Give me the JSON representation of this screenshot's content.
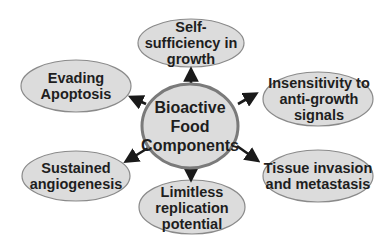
{
  "diagram": {
    "center": {
      "label": "Bioactive\nFood\nComponents"
    },
    "nodes": [
      {
        "id": "self-sufficiency",
        "label": "Self-\nsufficiency in\ngrowth"
      },
      {
        "id": "insensitivity",
        "label": "Insensitivity to\nanti-growth\nsignals"
      },
      {
        "id": "tissue-invasion",
        "label": "Tissue invasion\nand metastasis"
      },
      {
        "id": "limitless-replication",
        "label": "Limitless\nreplication\npotential"
      },
      {
        "id": "sustained-angiogenesis",
        "label": "Sustained\nangiogenesis"
      },
      {
        "id": "evading-apoptosis",
        "label": "Evading\nApoptosis"
      }
    ],
    "colors": {
      "ellipse_fill": "#dcdcdc",
      "ellipse_stroke": "#8a8a8a",
      "center_stroke": "#7a7a7a",
      "arrow": "#1a1a1a",
      "text": "#1e1e1e"
    }
  }
}
